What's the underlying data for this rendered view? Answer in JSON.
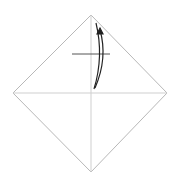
{
  "diagram": {
    "type": "origami-step",
    "colors": {
      "background": "#ffffff",
      "edge": "#b8b8b8",
      "crease": "#cfcfcf",
      "pinch": "#555555",
      "arrow": "#222222"
    },
    "paper": {
      "corners": {
        "top": [
          91,
          15
        ],
        "right": [
          167,
          93
        ],
        "bottom": [
          91,
          172
        ],
        "left": [
          13,
          93
        ]
      }
    },
    "creases": [
      {
        "name": "horizontal-diagonal",
        "from": [
          13,
          93
        ],
        "to": [
          167,
          93
        ]
      },
      {
        "name": "vertical-diagonal",
        "from": [
          91,
          15
        ],
        "to": [
          91,
          172
        ]
      }
    ],
    "pinch_mark": {
      "from": [
        72,
        54
      ],
      "to": [
        110,
        54
      ]
    },
    "arrow": {
      "kind": "fold-and-unfold",
      "start": [
        94,
        89
      ],
      "end": [
        100,
        28
      ]
    }
  }
}
